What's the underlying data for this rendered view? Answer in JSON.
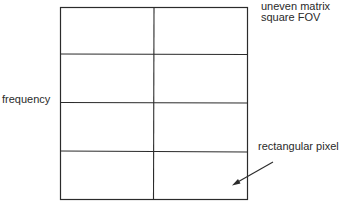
{
  "diagram": {
    "grid": {
      "rows": 4,
      "cols": 2
    },
    "labels": {
      "top_right_line1": "uneven matrix",
      "top_right_line2": "square FOV",
      "left_axis": "frequency",
      "callout": "rectangular pixel"
    },
    "colors": {
      "line": "#2b2b2b",
      "background": "#ffffff"
    }
  }
}
